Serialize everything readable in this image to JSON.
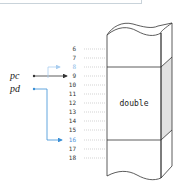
{
  "diagram": {
    "pointers": [
      {
        "name": "pc",
        "target_address": "9",
        "color": "#333333"
      },
      {
        "name": "pd",
        "target_address": "16",
        "color": "#3a8fd6"
      }
    ],
    "faint_pointer_target": "8",
    "addresses": [
      "6",
      "7",
      "8",
      "9",
      "10",
      "11",
      "12",
      "13",
      "14",
      "15",
      "16",
      "17",
      "18"
    ],
    "highlighted_address": "16",
    "faint_address": "8",
    "memory_block": {
      "label": "double",
      "start_address": "8",
      "end_address": "15"
    },
    "colors": {
      "pd_arrow": "#3a8fd6",
      "faint_arrow": "#a9cdef",
      "side_shade": "#e2e2e2",
      "dots": "#b5b5b5"
    }
  }
}
